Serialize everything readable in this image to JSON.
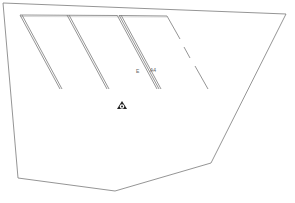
{
  "drawing": {
    "background": "#ffffff",
    "line_color": "#7a7a7a",
    "outline": [
      [
        3,
        3
      ],
      [
        286,
        14
      ],
      [
        211,
        163
      ],
      [
        115,
        191
      ],
      [
        18,
        178
      ],
      [
        3,
        3
      ]
    ],
    "inner_top": [
      [
        20,
        15
      ],
      [
        167,
        15
      ]
    ],
    "stripes": [
      {
        "from": [
          20,
          15
        ],
        "to": [
          60,
          89
        ]
      },
      {
        "from": [
          67,
          15
        ],
        "to": [
          108,
          89
        ]
      },
      {
        "from": [
          117,
          15
        ],
        "to": [
          160,
          89
        ]
      }
    ],
    "dashed_line": {
      "from": [
        167,
        15
      ],
      "to": [
        207,
        90
      ]
    },
    "labels": {
      "left": "E",
      "right": "A4"
    },
    "symbol": {
      "name": "north-marker",
      "x": 122,
      "y": 106
    }
  }
}
